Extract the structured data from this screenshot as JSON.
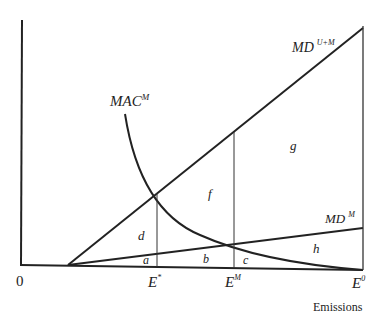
{
  "diagram": {
    "type": "economics-marginal-damage-abatement",
    "curves": {
      "md_um": {
        "label": "MD",
        "superscript": "U+M"
      },
      "md_m": {
        "label": "MD",
        "superscript": "M"
      },
      "mac_m": {
        "label": "MAC",
        "superscript": "M"
      }
    },
    "axis": {
      "origin_label": "0",
      "x_label": "Emissions"
    },
    "ticks": {
      "e_star": {
        "label": "E",
        "superscript": "*"
      },
      "e_m": {
        "label": "E",
        "superscript": "M"
      },
      "e_0": {
        "label": "E",
        "superscript": "0"
      }
    },
    "regions": {
      "a": "a",
      "b": "b",
      "c": "c",
      "d": "d",
      "f": "f",
      "g": "g",
      "h": "h"
    }
  }
}
